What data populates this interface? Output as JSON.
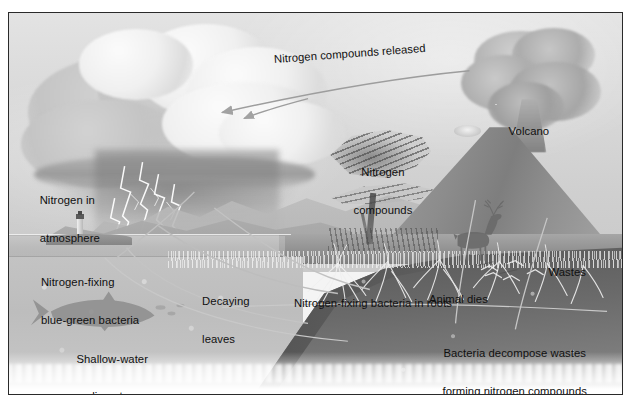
{
  "figure": {
    "type": "scientific-illustration",
    "style": "grayscale airbrush painting",
    "frame_color": "#2a2a2a",
    "background_color": "#ffffff"
  },
  "labels": {
    "nitrogen_compounds_released": "Nitrogen compounds released",
    "volcano": "Volcano",
    "nitrogen_compounds_line1": "Nitrogen",
    "nitrogen_compounds_line2": "compounds",
    "nitrogen_in_atmosphere_line1": "Nitrogen in",
    "nitrogen_in_atmosphere_line2": "atmosphere",
    "nitrogen_fixing_bacteria_line1": "Nitrogen-fixing",
    "nitrogen_fixing_bacteria_line2": "blue-green bacteria",
    "decaying_leaves_line1": "Decaying",
    "decaying_leaves_line2": "leaves",
    "nitrogen_fixing_roots": "Nitrogen-fixing bacteria in roots",
    "shallow_water_line1": "Shallow-water",
    "shallow_water_line2": "sediments",
    "wastes": "Wastes",
    "animal_dies": "Animal dies",
    "bacteria_decompose_line1": "Bacteria decompose wastes",
    "bacteria_decompose_line2": "forming nitrogen compounds"
  },
  "scene_elements": {
    "cloud": "thunderstorm-cloud",
    "lightning": "lightning-bolts",
    "lighthouse": "lighthouse",
    "fish": "fish-silhouette",
    "volcano": "erupting-volcano",
    "ash_plume": "volcanic-ash-plume",
    "tree": "wind-blown-tree",
    "deer": "deer",
    "roots": "plant-root-system",
    "soil": "soil-cutaway",
    "ocean": "ocean-water",
    "mountains": "mountain-range"
  },
  "colors": {
    "ink": "#101010",
    "sky_light": "#e3e3e3",
    "sky_dark": "#c9c9c9",
    "water": "#a9a9a9",
    "soil_dark": "#4b4b4b",
    "soil_mid": "#787878",
    "grass": "#8e8e8e",
    "arrow": "#a8a8a8"
  }
}
